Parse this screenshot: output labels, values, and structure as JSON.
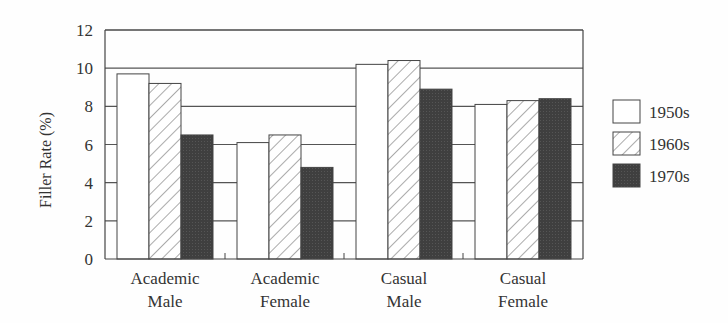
{
  "chart_data": {
    "type": "bar",
    "title": "",
    "xlabel": "",
    "ylabel": "Filler Rate (%)",
    "ylim": [
      0,
      12
    ],
    "yticks": [
      0,
      2,
      4,
      6,
      8,
      10,
      12
    ],
    "grid": true,
    "legend_position": "right",
    "categories": [
      [
        "Academic",
        "Male"
      ],
      [
        "Academic",
        "Female"
      ],
      [
        "Casual",
        "Male"
      ],
      [
        "Casual",
        "Female"
      ]
    ],
    "series": [
      {
        "name": "1950s",
        "pattern": "white",
        "values": [
          9.7,
          6.1,
          10.2,
          8.1
        ]
      },
      {
        "name": "1960s",
        "pattern": "hatched",
        "values": [
          9.2,
          6.5,
          10.4,
          8.3
        ]
      },
      {
        "name": "1970s",
        "pattern": "dark",
        "values": [
          6.5,
          4.8,
          8.9,
          8.4
        ]
      }
    ]
  },
  "colors": {
    "background": "#fefefe",
    "axis": "#444444",
    "grid": "#555555",
    "bar_white": "#ffffff",
    "bar_dark": "#3f3f3f",
    "hatch": "#555555",
    "text": "#333333"
  }
}
